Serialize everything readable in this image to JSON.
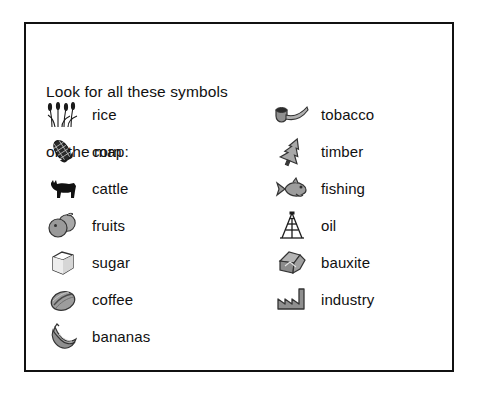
{
  "card": {
    "heading_line1": "Look for all these symbols",
    "heading_line2": "on the map:",
    "border_color": "#111111",
    "background_color": "#ffffff",
    "text_color": "#111111"
  },
  "legend": {
    "left_column": [
      {
        "icon": "rice-icon",
        "label": "rice"
      },
      {
        "icon": "corn-icon",
        "label": "corn"
      },
      {
        "icon": "cattle-icon",
        "label": "cattle"
      },
      {
        "icon": "fruits-icon",
        "label": "fruits"
      },
      {
        "icon": "sugar-icon",
        "label": "sugar"
      },
      {
        "icon": "coffee-icon",
        "label": "coffee"
      },
      {
        "icon": "bananas-icon",
        "label": "bananas"
      }
    ],
    "right_column": [
      {
        "icon": "tobacco-pipe-icon",
        "label": "tobacco"
      },
      {
        "icon": "timber-tree-icon",
        "label": "timber"
      },
      {
        "icon": "fishing-fish-icon",
        "label": "fishing"
      },
      {
        "icon": "oil-derrick-icon",
        "label": "oil"
      },
      {
        "icon": "bauxite-ore-icon",
        "label": "bauxite"
      },
      {
        "icon": "industry-factory-icon",
        "label": "industry"
      }
    ]
  },
  "palette": {
    "symbol_dark": "#1b1b1b",
    "symbol_mid": "#8a8a8a",
    "symbol_light": "#c4c4c4",
    "symbol_outline": "#333333"
  }
}
